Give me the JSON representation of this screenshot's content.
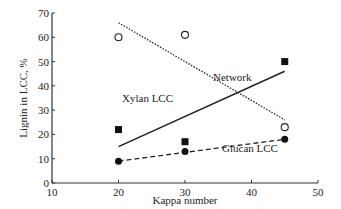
{
  "chart_data": {
    "type": "scatter",
    "title": "",
    "xlabel": "Kappa number",
    "ylabel": "Lignin in LCC, %",
    "xlim": [
      10,
      50
    ],
    "ylim": [
      0,
      70
    ],
    "xticks": [
      10,
      20,
      30,
      40,
      50
    ],
    "yticks": [
      0,
      10,
      20,
      30,
      40,
      50,
      60,
      70
    ],
    "grid": false,
    "series": [
      {
        "name": "Network",
        "marker": "open-circle",
        "line": "dotted",
        "x": [
          20,
          30,
          45
        ],
        "values": [
          60,
          61,
          23
        ],
        "fit": [
          [
            20,
            66
          ],
          [
            45,
            26
          ]
        ]
      },
      {
        "name": "Xylan LCC",
        "marker": "filled-square",
        "line": "solid",
        "x": [
          20,
          30,
          45
        ],
        "values": [
          22,
          17,
          50
        ],
        "fit": [
          [
            20,
            15
          ],
          [
            45,
            46
          ]
        ]
      },
      {
        "name": "Glucan LCC",
        "marker": "filled-circle",
        "line": "dashed",
        "x": [
          20,
          30,
          45
        ],
        "values": [
          9,
          13,
          18
        ],
        "fit": [
          [
            20,
            9
          ],
          [
            45,
            18
          ]
        ]
      }
    ]
  }
}
